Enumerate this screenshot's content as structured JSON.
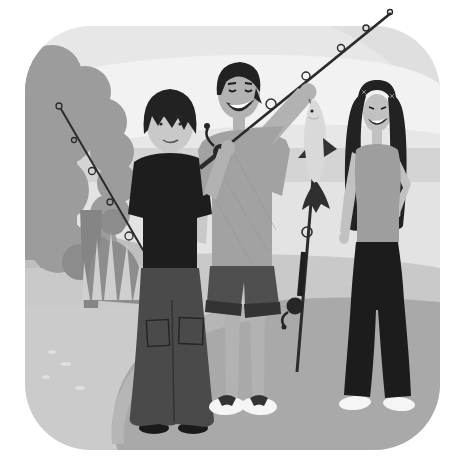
{
  "meta": {
    "alt": "Grayscale cartoon illustration in a rounded square: three teenagers standing on a lakeside path with fishing rods. A boy in a black t-shirt and baggy cargo pants holds a rod angled toward a large tree on the left; a smiling boy in the middle carries a rod over his shoulder and lifts a caught fish with his raised hand; a girl with long dark hair, tank top and black flared pants stands beside an upright fishing rod with one hand on her hip."
  },
  "palette": {
    "page": "#ffffff",
    "sky": "#e7e7e7",
    "sky-light": "#f2f2f2",
    "sky-corner": "#dfdfdf",
    "water": "#d4d4d4",
    "water-light": "#e3e3e3",
    "shore": "#c9c9c9",
    "hill": "#bfbfbf",
    "ground": "#cbcbcb",
    "path": "#a9a9a9",
    "path-light": "#b6b6b6",
    "pebble": "#e0e0e0",
    "tree": "#9c9c9c",
    "tree-dark": "#8c8c8c",
    "trunk": "#858585",
    "rock": "#8d8d8d",
    "grass-light": "#cfcfcf",
    "ink": "#222222",
    "shirt-black": "#1d1d1d",
    "pants-gray": "#4a4a4a",
    "shorts": "#4f4f4f",
    "cuff": "#333333",
    "shirt-gray": "#a2a2a2",
    "tank": "#9e9e9e",
    "skin-light": "#c9c9c9",
    "skin-mid": "#b2b2b2",
    "skin-girl": "#c1c1c1",
    "fish": "#d9d9d9",
    "fish-fin": "#333333",
    "dark-detail": "#262626",
    "white": "#f5f5f5",
    "rod": "#2b2b2b",
    "teeth": "#ffffff"
  },
  "scene": {
    "figures": [
      {
        "id": "boy-left",
        "description": "Boy in black t-shirt and baggy cargo pants holding a fishing rod angled up toward the tree"
      },
      {
        "id": "boy-middle",
        "description": "Smiling boy in gray t-shirt and shorts, rod over shoulder, holding up a caught fish"
      },
      {
        "id": "girl",
        "description": "Girl with long dark hair, gray tank top, black flared pants, hand on hip beside an upright rod"
      }
    ],
    "objects": [
      "tree",
      "lake",
      "shore",
      "stone path",
      "fish",
      "fishing rods"
    ]
  }
}
